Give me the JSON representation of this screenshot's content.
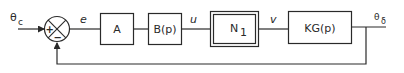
{
  "diagram": {
    "type": "feedback-control-block-diagram",
    "input": {
      "label_main": "θ",
      "label_sub": "c"
    },
    "output": {
      "label_main": "θ",
      "label_sub": "δ"
    },
    "summing_junction": {
      "plus": "+",
      "minus": "−"
    },
    "signals": {
      "error": "e",
      "control": "u",
      "nonlinear_out": "v"
    },
    "blocks": [
      {
        "id": "A",
        "label": "A"
      },
      {
        "id": "B",
        "label": "B(p)"
      },
      {
        "id": "N1",
        "label_main": "N",
        "label_sub": "1",
        "style": "double-border"
      },
      {
        "id": "KG",
        "label": "KG(p)"
      }
    ],
    "feedback": "unity negative feedback from θδ to summing junction",
    "colors": {
      "stroke": "#2a2a2a",
      "background": "#ffffff"
    }
  }
}
